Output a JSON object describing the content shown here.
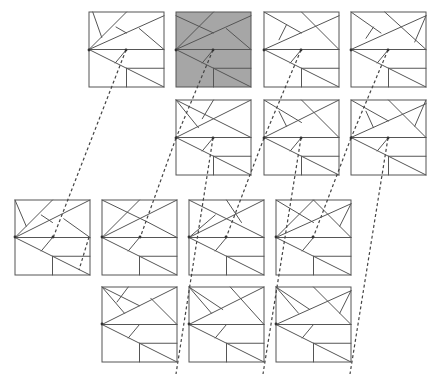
{
  "diagram": {
    "title": "",
    "background": "#ffffff",
    "stroke_color": "#555555",
    "highlight_fill": "#a6a6a6",
    "square_size": 75,
    "squares": [
      {
        "id": "r1c1",
        "x": 89,
        "y": 12,
        "fill": "#ffffff",
        "variant": "A"
      },
      {
        "id": "r1c2",
        "x": 176,
        "y": 12,
        "fill": "#a6a6a6",
        "variant": "B"
      },
      {
        "id": "r1c3",
        "x": 264,
        "y": 12,
        "fill": "#ffffff",
        "variant": "C"
      },
      {
        "id": "r1c4",
        "x": 351,
        "y": 12,
        "fill": "#ffffff",
        "variant": "D"
      },
      {
        "id": "r2c2",
        "x": 176,
        "y": 100,
        "fill": "#ffffff",
        "variant": "E"
      },
      {
        "id": "r2c3",
        "x": 264,
        "y": 100,
        "fill": "#ffffff",
        "variant": "F"
      },
      {
        "id": "r2c4",
        "x": 351,
        "y": 100,
        "fill": "#ffffff",
        "variant": "G"
      },
      {
        "id": "r3c1",
        "x": 15,
        "y": 200,
        "fill": "#ffffff",
        "variant": "H"
      },
      {
        "id": "r3c2",
        "x": 102,
        "y": 200,
        "fill": "#ffffff",
        "variant": "I"
      },
      {
        "id": "r3c3",
        "x": 189,
        "y": 200,
        "fill": "#ffffff",
        "variant": "J"
      },
      {
        "id": "r3c4",
        "x": 276,
        "y": 200,
        "fill": "#ffffff",
        "variant": "K"
      },
      {
        "id": "r4c2",
        "x": 102,
        "y": 287,
        "fill": "#ffffff",
        "variant": "L"
      },
      {
        "id": "r4c3",
        "x": 189,
        "y": 287,
        "fill": "#ffffff",
        "variant": "M"
      },
      {
        "id": "r4c4",
        "x": 276,
        "y": 287,
        "fill": "#ffffff",
        "variant": "N"
      }
    ],
    "common_segments": [
      [
        0,
        0.5,
        1,
        0.5
      ],
      [
        0,
        0.5,
        1,
        1
      ],
      [
        0.5,
        0.75,
        1,
        0.75
      ],
      [
        0.5,
        0.75,
        0.5,
        1
      ],
      [
        0.35,
        0.68,
        0.5,
        0.5
      ]
    ],
    "variants": {
      "A": [
        [
          0,
          0.5,
          1,
          0.05
        ],
        [
          0,
          0.5,
          0.5,
          0
        ],
        [
          0.05,
          0,
          0.17,
          0.34
        ],
        [
          0.36,
          0.2,
          0.5,
          0.28
        ],
        [
          0.67,
          0.22,
          1,
          0.5
        ]
      ],
      "B": [
        [
          0,
          0.5,
          1,
          0.05
        ],
        [
          0,
          0.5,
          0.5,
          0
        ],
        [
          0,
          0.05,
          0.5,
          0.28
        ],
        [
          0.67,
          0.22,
          1,
          0.5
        ]
      ],
      "C": [
        [
          0,
          0.5,
          1,
          0.05
        ],
        [
          0,
          0,
          0.5,
          0.28
        ],
        [
          0.3,
          0.17,
          0.2,
          0.37
        ],
        [
          0.5,
          0,
          1,
          0.5
        ]
      ],
      "D": [
        [
          0,
          0.5,
          1,
          0.05
        ],
        [
          0,
          0,
          0.4,
          0.28
        ],
        [
          0.3,
          0.2,
          0.2,
          0.35
        ],
        [
          0.45,
          0,
          1,
          0.5
        ],
        [
          1,
          0.05,
          0.85,
          0.4
        ]
      ],
      "E": [
        [
          0,
          0,
          1,
          0.5
        ],
        [
          0,
          0.5,
          1,
          0
        ],
        [
          0,
          0,
          0.3,
          0.37
        ],
        [
          0.35,
          0.25,
          0.5,
          0.0
        ]
      ],
      "F": [
        [
          0,
          0.5,
          1,
          0
        ],
        [
          0,
          0,
          0.5,
          0.3
        ],
        [
          0.2,
          0.15,
          0.3,
          0.35
        ],
        [
          0.5,
          0,
          1,
          0.5
        ]
      ],
      "G": [
        [
          0,
          0.5,
          1,
          0.05
        ],
        [
          0,
          0,
          0.5,
          0.28
        ],
        [
          0.2,
          0.15,
          0.3,
          0.37
        ],
        [
          0.5,
          0,
          1,
          0.5
        ],
        [
          1,
          0,
          0.85,
          0.35
        ]
      ],
      "H": [
        [
          0,
          0.5,
          1,
          0
        ],
        [
          0,
          0.5,
          0.5,
          0
        ],
        [
          0,
          0,
          0.15,
          0.35
        ],
        [
          0.35,
          0.2,
          0.5,
          0.3
        ],
        [
          0.65,
          0.25,
          1,
          0.5
        ]
      ],
      "I": [
        [
          0,
          0.5,
          1,
          0
        ],
        [
          0,
          0.5,
          0.5,
          0
        ],
        [
          0,
          0,
          0.62,
          0.3
        ],
        [
          0.62,
          0.3,
          1,
          0.5
        ]
      ],
      "J": [
        [
          0,
          0,
          1,
          0.5
        ],
        [
          0,
          0.5,
          1,
          0
        ],
        [
          0,
          0.5,
          0.35,
          0.2
        ],
        [
          0.5,
          0,
          0.7,
          0.3
        ]
      ],
      "K": [
        [
          0,
          0.5,
          1,
          0.05
        ],
        [
          0,
          0.5,
          0.5,
          0
        ],
        [
          0,
          0,
          0.5,
          0.3
        ],
        [
          0.5,
          0,
          1,
          0.5
        ],
        [
          1,
          0.05,
          0.85,
          0.35
        ]
      ],
      "L": [
        [
          0,
          0.5,
          1,
          0
        ],
        [
          0,
          0,
          0.5,
          0.25
        ],
        [
          0.35,
          0,
          0.2,
          0.2
        ],
        [
          0,
          0,
          0.3,
          0.35
        ],
        [
          0.65,
          0.15,
          1,
          0.5
        ]
      ],
      "M": [
        [
          0,
          0.5,
          1,
          0
        ],
        [
          0,
          0,
          0.45,
          0.3
        ],
        [
          0,
          0,
          0.3,
          0.35
        ],
        [
          0.55,
          0,
          1,
          0.5
        ]
      ],
      "N": [
        [
          0,
          0.5,
          1,
          0.05
        ],
        [
          0,
          0,
          0.45,
          0.3
        ],
        [
          0,
          0,
          0.3,
          0.35
        ],
        [
          0.5,
          0,
          1,
          0.5
        ],
        [
          1,
          0.05,
          0.85,
          0.35
        ]
      ]
    },
    "connectors": [
      {
        "from": [
          126,
          50
        ],
        "to": [
          53,
          238
        ],
        "label": "r1c1-to-r3c1"
      },
      {
        "from": [
          213,
          50
        ],
        "to": [
          176,
          138
        ],
        "label": "r1c2-to-r2c2"
      },
      {
        "from": [
          301,
          50
        ],
        "to": [
          264,
          138
        ],
        "label": "r1c3-to-r2c3"
      },
      {
        "from": [
          388,
          50
        ],
        "to": [
          351,
          138
        ],
        "label": "r1c4-to-r2c4"
      },
      {
        "from": [
          176,
          138
        ],
        "to": [
          140,
          238
        ],
        "label": "r2c2-to-r3c2"
      },
      {
        "from": [
          213,
          138
        ],
        "to": [
          176,
          374
        ],
        "label": "r2c2-to-r4c2"
      },
      {
        "from": [
          264,
          138
        ],
        "to": [
          226,
          238
        ],
        "label": "r2c3-to-r3c3"
      },
      {
        "from": [
          301,
          138
        ],
        "to": [
          263,
          374
        ],
        "label": "r2c3-to-r4c3"
      },
      {
        "from": [
          351,
          138
        ],
        "to": [
          313,
          238
        ],
        "label": "r2c4-to-r3c4"
      },
      {
        "from": [
          388,
          138
        ],
        "to": [
          350,
          374
        ],
        "label": "r2c4-to-r4c4"
      },
      {
        "from": [
          89,
          237
        ],
        "to": [
          79,
          270
        ],
        "label": "r3c1-right"
      }
    ],
    "dots": [
      [
        126,
        50
      ],
      [
        213,
        50
      ],
      [
        301,
        50
      ],
      [
        388,
        50
      ],
      [
        176,
        138
      ],
      [
        213,
        138
      ],
      [
        264,
        138
      ],
      [
        301,
        138
      ],
      [
        351,
        138
      ],
      [
        388,
        138
      ],
      [
        53,
        237
      ],
      [
        140,
        237
      ],
      [
        226,
        237
      ],
      [
        313,
        237
      ],
      [
        15,
        237
      ],
      [
        102,
        237
      ],
      [
        189,
        237
      ],
      [
        276,
        237
      ],
      [
        89,
        50
      ],
      [
        176,
        50
      ],
      [
        264,
        50
      ],
      [
        351,
        50
      ],
      [
        102,
        324
      ],
      [
        189,
        324
      ],
      [
        276,
        324
      ]
    ]
  }
}
